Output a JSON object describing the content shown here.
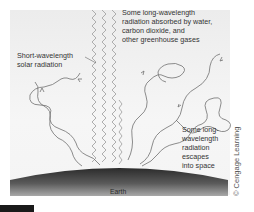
{
  "diagram": {
    "labels": {
      "absorbed": "Some long-wavelength\nradiation absorbed by water,\ncarbon dioxide, and\nother greenhouse gases",
      "short_wave": "Short-wavelength\nsolar radiation",
      "escapes": "Some long-\nwavelength\nradiation\nescapes\ninto space",
      "earth": "Earth"
    },
    "credit": "© Cengage Learning",
    "colors": {
      "background_panel": "#f2f2f2",
      "solar_wave": "#9a9a9a",
      "long_wave": "#6a6a6a",
      "earth_dark": "#2b2b2b",
      "earth_light": "#9a9a9a"
    }
  }
}
